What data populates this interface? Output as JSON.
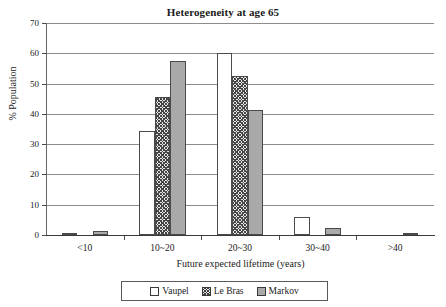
{
  "chart_data": {
    "type": "bar",
    "title": "Heterogeneity at age 65",
    "xlabel": "Future expected lifetime (years)",
    "ylabel": "% Population",
    "categories": [
      "<10",
      "10~20",
      "20~30",
      "30~40",
      ">40"
    ],
    "series": [
      {
        "name": "Vaupel",
        "values": [
          0.4,
          34.4,
          60.0,
          6.0,
          0.0
        ],
        "fill": "white",
        "color": "#ffffff"
      },
      {
        "name": "Le Bras",
        "values": [
          0.0,
          45.7,
          52.4,
          0.0,
          0.0
        ],
        "fill": "crosshatch",
        "color": "#454545"
      },
      {
        "name": "Markov",
        "values": [
          1.2,
          57.6,
          41.2,
          2.3,
          0.3
        ],
        "fill": "solid-gray",
        "color": "#a9a9a9"
      }
    ],
    "ylim": [
      0,
      70
    ],
    "yticks": [
      0,
      10,
      20,
      30,
      40,
      50,
      60,
      70
    ],
    "ytick_labels": [
      "0",
      "10",
      "20",
      "30",
      "40",
      "50",
      "60",
      "70"
    ],
    "grid": true,
    "grid_axis": "y",
    "legend_position": "bottom",
    "legend_entries": [
      "Vaupel",
      "Le Bras",
      "Markov"
    ]
  }
}
